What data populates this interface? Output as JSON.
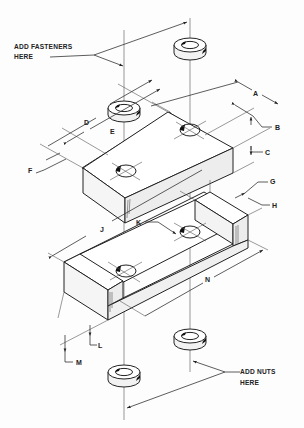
{
  "notes": {
    "fasteners_line1": "ADD FASTENERS",
    "fasteners_line2": "HERE",
    "nuts_line1": "ADD NUTS",
    "nuts_line2": "HERE"
  },
  "dimensions": {
    "A": "A",
    "B": "B",
    "C": "C",
    "D": "D",
    "E": "E",
    "F": "F",
    "G": "G",
    "H": "H",
    "J": "J",
    "K": "K",
    "L": "L",
    "M": "M",
    "N": "N"
  },
  "parts": [
    {
      "name": "top-washer-left"
    },
    {
      "name": "top-washer-right"
    },
    {
      "name": "upper-block"
    },
    {
      "name": "lower-channel-block"
    },
    {
      "name": "bottom-nut-right"
    },
    {
      "name": "bottom-nut-left"
    }
  ],
  "colors": {
    "line": "#222222",
    "face_top": "#ffffff",
    "face_front": "#f4f4f4",
    "face_side": "#eaeaea"
  }
}
